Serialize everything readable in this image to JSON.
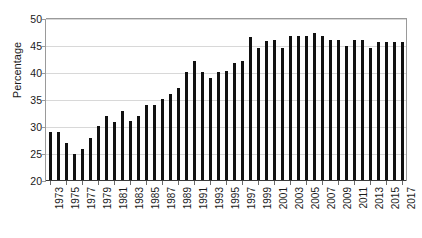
{
  "chart_data": {
    "type": "bar",
    "title": "",
    "xlabel": "",
    "ylabel": "Percentage",
    "ylim": [
      20,
      50
    ],
    "yticks": [
      20,
      25,
      30,
      35,
      40,
      45,
      50
    ],
    "grid": true,
    "legend": "none",
    "bar_color": "#111111",
    "xtick_step": 2,
    "xtick_labels": [
      "1973",
      "1975",
      "1977",
      "1979",
      "1981",
      "1983",
      "1985",
      "1987",
      "1989",
      "1991",
      "1993",
      "1995",
      "1997",
      "1999",
      "2001",
      "2003",
      "2005",
      "2007",
      "2009",
      "2011",
      "2013",
      "2015",
      "2017"
    ],
    "categories": [
      "1973",
      "1974",
      "1975",
      "1976",
      "1977",
      "1978",
      "1979",
      "1980",
      "1981",
      "1982",
      "1983",
      "1984",
      "1985",
      "1986",
      "1987",
      "1988",
      "1989",
      "1990",
      "1991",
      "1992",
      "1993",
      "1994",
      "1995",
      "1996",
      "1997",
      "1998",
      "1999",
      "2000",
      "2001",
      "2002",
      "2003",
      "2004",
      "2005",
      "2006",
      "2007",
      "2008",
      "2009",
      "2010",
      "2011",
      "2012",
      "2013",
      "2014",
      "2015",
      "2016",
      "2017"
    ],
    "values": [
      29.0,
      29.0,
      27.0,
      25.0,
      26.0,
      28.0,
      30.1,
      32.0,
      31.0,
      33.0,
      31.1,
      32.0,
      34.1,
      34.1,
      35.1,
      36.2,
      37.2,
      40.2,
      42.2,
      40.2,
      39.0,
      40.2,
      40.4,
      41.8,
      42.3,
      46.6,
      44.7,
      46.0,
      46.2,
      44.6,
      46.9,
      46.9,
      46.9,
      47.4,
      46.9,
      46.1,
      46.1,
      45.0,
      46.1,
      46.2,
      44.6,
      45.7,
      45.7,
      45.7,
      45.7
    ]
  }
}
